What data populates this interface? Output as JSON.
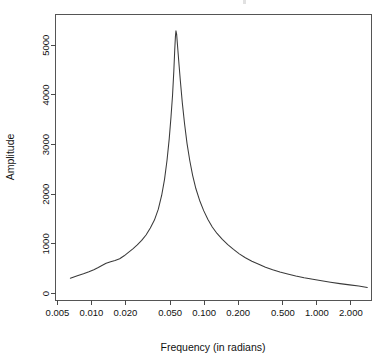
{
  "chart_data": {
    "type": "line",
    "title": "",
    "xlabel": "Frequency (in radians)",
    "ylabel": "Amplitude",
    "xscale": "log",
    "yscale": "linear",
    "grid": false,
    "legend": "none",
    "xlim": [
      0.0048,
      3.05
    ],
    "ylim": [
      -130,
      5620
    ],
    "xticks": [
      0.005,
      0.01,
      0.02,
      0.05,
      0.1,
      0.2,
      0.5,
      1.0,
      2.0
    ],
    "xtick_labels": [
      "0.005",
      "0.010",
      "0.020",
      "0.050",
      "0.100",
      "0.200",
      "0.500",
      "1.000",
      "2.000"
    ],
    "yticks": [
      0,
      1000,
      2000,
      3000,
      4000,
      5000
    ],
    "ytick_labels": [
      "0",
      "1000",
      "2000",
      "3000",
      "4000",
      "5000"
    ],
    "series": [
      {
        "name": "spectrum",
        "x": [
          0.0065,
          0.0075,
          0.0085,
          0.0095,
          0.0105,
          0.0115,
          0.0125,
          0.0135,
          0.0148,
          0.0162,
          0.0178,
          0.0195,
          0.0213,
          0.0233,
          0.0255,
          0.0279,
          0.0305,
          0.0333,
          0.0362,
          0.0392,
          0.042,
          0.0445,
          0.0468,
          0.049,
          0.0508,
          0.0524,
          0.0538,
          0.0548,
          0.0556,
          0.0562,
          0.057,
          0.058,
          0.0595,
          0.0615,
          0.064,
          0.067,
          0.0705,
          0.0745,
          0.079,
          0.0845,
          0.091,
          0.099,
          0.108,
          0.118,
          0.13,
          0.145,
          0.162,
          0.182,
          0.205,
          0.232,
          0.265,
          0.305,
          0.35,
          0.405,
          0.47,
          0.55,
          0.65,
          0.77,
          0.92,
          1.1,
          1.32,
          1.6,
          1.95,
          2.35,
          2.8
        ],
        "y": [
          310,
          360,
          400,
          440,
          480,
          525,
          570,
          610,
          640,
          665,
          700,
          760,
          830,
          900,
          980,
          1070,
          1180,
          1320,
          1480,
          1700,
          1980,
          2300,
          2680,
          3120,
          3560,
          3990,
          4480,
          4900,
          5180,
          5290,
          5220,
          5000,
          4680,
          4280,
          3840,
          3420,
          3020,
          2680,
          2380,
          2110,
          1880,
          1670,
          1490,
          1340,
          1210,
          1090,
          985,
          890,
          800,
          720,
          650,
          590,
          530,
          480,
          435,
          395,
          355,
          320,
          288,
          258,
          228,
          200,
          175,
          150,
          122
        ]
      }
    ],
    "peak": {
      "x": 0.0562,
      "y": 5290
    },
    "annotations": []
  },
  "axes": {
    "x_title": "Frequency (in radians)",
    "y_title": "Amplitude"
  }
}
